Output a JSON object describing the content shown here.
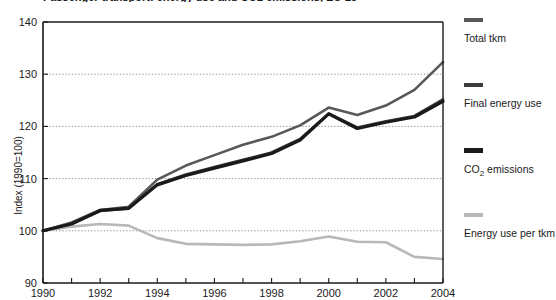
{
  "title_fragment": "Passenger transport: energy use and CO2 emissions, EU-25",
  "axes": {
    "ylabel": "Index (1990=100)",
    "y_ticks": [
      90,
      100,
      110,
      120,
      130,
      140
    ],
    "x_ticks_labeled": [
      1990,
      1992,
      1994,
      1996,
      1998,
      2000,
      2002,
      2004
    ],
    "x_ticks_all": [
      1990,
      1991,
      1992,
      1993,
      1994,
      1995,
      1996,
      1997,
      1998,
      1999,
      2000,
      2001,
      2002,
      2003,
      2004
    ]
  },
  "legend": [
    {
      "label": "Total tkm",
      "color": "#58585a",
      "icon": "line-swatch",
      "thickness": 4
    },
    {
      "label": "Final energy use",
      "color": "#3d3d3f",
      "icon": "line-swatch",
      "thickness": 4
    },
    {
      "label": "CO2 emissions",
      "label_html": "CO",
      "sub": "2",
      "label_rest": " emissions",
      "color": "#1a1a1a",
      "icon": "line-swatch",
      "thickness": 5
    },
    {
      "label": "Energy use per tkm",
      "color": "#b8b8b8",
      "icon": "line-swatch",
      "thickness": 4
    }
  ],
  "chart_data": {
    "type": "line",
    "title": "Passenger transport: energy use and CO2 emissions, EU-25",
    "xlabel": "",
    "ylabel": "Index (1990=100)",
    "xlim": [
      1990,
      2004
    ],
    "ylim": [
      90,
      140
    ],
    "grid": "horizontal-dotted",
    "legend_position": "right",
    "x": [
      1990,
      1991,
      1992,
      1993,
      1994,
      1995,
      1996,
      1997,
      1998,
      1999,
      2000,
      2001,
      2002,
      2003,
      2004
    ],
    "series": [
      {
        "name": "Total tkm",
        "color": "#58585a",
        "values": [
          100.0,
          101.6,
          104.0,
          104.6,
          109.8,
          112.5,
          114.5,
          116.5,
          118.0,
          120.2,
          123.6,
          122.2,
          124.0,
          127.0,
          132.3
        ]
      },
      {
        "name": "Final energy use",
        "color": "#3d3d3f",
        "values": [
          100.0,
          101.4,
          103.8,
          104.3,
          108.9,
          110.8,
          112.2,
          113.6,
          115.0,
          117.6,
          122.5,
          119.8,
          121.0,
          122.0,
          125.2
        ]
      },
      {
        "name": "CO2 emissions",
        "color": "#1a1a1a",
        "values": [
          100.0,
          101.3,
          103.9,
          104.3,
          108.8,
          110.6,
          112.0,
          113.4,
          114.8,
          117.4,
          122.4,
          119.6,
          120.8,
          121.8,
          124.8
        ]
      },
      {
        "name": "Energy use per tkm",
        "color": "#b8b8b8",
        "values": [
          100.0,
          100.8,
          101.3,
          101.0,
          98.6,
          97.5,
          97.4,
          97.3,
          97.4,
          98.0,
          98.9,
          97.9,
          97.8,
          95.0,
          94.6
        ]
      }
    ]
  }
}
